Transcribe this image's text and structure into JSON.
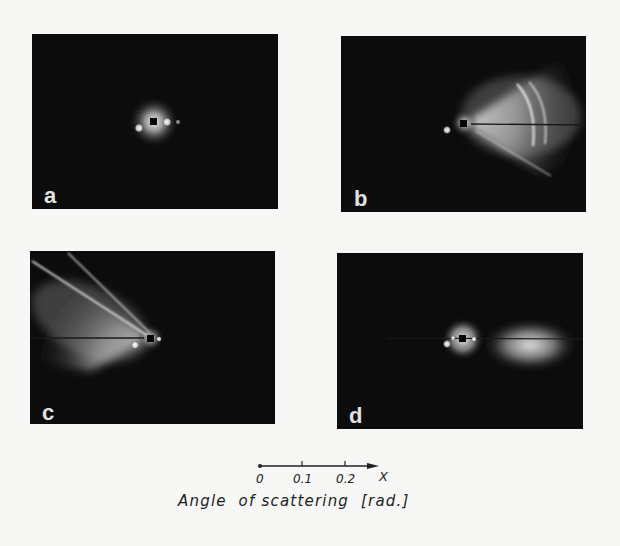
{
  "figure": {
    "panels": [
      {
        "id": "a",
        "label": "a",
        "pattern": "central halo with two side spots"
      },
      {
        "id": "b",
        "label": "b",
        "pattern": "fan-shaped scattering to the right with two arcs and diagonal streak"
      },
      {
        "id": "c",
        "label": "c",
        "pattern": "fan-shaped scattering to the upper left with two streaks"
      },
      {
        "id": "d",
        "label": "d",
        "pattern": "central halo plus elongated diffuse spot to the right"
      }
    ],
    "axis": {
      "ticks": [
        "0",
        "0.1",
        "0.2"
      ],
      "arrow_label": "X",
      "caption": "Angle  of scattering  [rad.]"
    },
    "colors": {
      "background": "#f7f7f5",
      "panel": "#0c0c0c",
      "glow": "#ffffff",
      "label": "#e2e2e2",
      "ink": "#222222"
    }
  }
}
